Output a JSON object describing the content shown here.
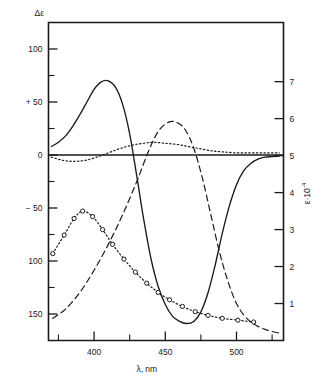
{
  "chart_data": {
    "type": "line",
    "title": "",
    "xlabel": "λ, nm",
    "ylabel_left": "Δε",
    "ylabel_right": "ε·10",
    "ylabel_right_exponent": "-4",
    "xlim": [
      368,
      533
    ],
    "ylim_left": [
      -175,
      125
    ],
    "ylim_right": [
      0,
      8.6
    ],
    "grid": false,
    "legend": "none",
    "xticks_major": [
      400,
      450,
      500
    ],
    "xticks_major_labels": [
      "400",
      "450",
      "500"
    ],
    "xticks_minor": [
      375,
      425,
      475,
      525
    ],
    "yticks_left": [
      100,
      50,
      0,
      -50,
      -100,
      -150
    ],
    "yticks_left_labels": [
      "100",
      "+ 50",
      "0",
      "− 50",
      "100",
      "150"
    ],
    "yticks_left_minor": [
      75,
      25,
      -25,
      -75,
      -125
    ],
    "yticks_right": [
      1,
      2,
      3,
      4,
      5,
      6,
      7
    ],
    "yticks_right_labels": [
      "1",
      "2",
      "3",
      "4",
      "5",
      "6",
      "7"
    ],
    "series": [
      {
        "name": "CD bisignate",
        "style": "solid",
        "axis": "left",
        "markers": "none",
        "points": [
          [
            370,
            8
          ],
          [
            375,
            12
          ],
          [
            380,
            18
          ],
          [
            385,
            27
          ],
          [
            390,
            38
          ],
          [
            395,
            50
          ],
          [
            400,
            62
          ],
          [
            405,
            69
          ],
          [
            410,
            70
          ],
          [
            415,
            64
          ],
          [
            420,
            48
          ],
          [
            425,
            20
          ],
          [
            430,
            -20
          ],
          [
            435,
            -62
          ],
          [
            440,
            -98
          ],
          [
            445,
            -124
          ],
          [
            450,
            -141
          ],
          [
            455,
            -152
          ],
          [
            460,
            -157
          ],
          [
            465,
            -159
          ],
          [
            470,
            -157
          ],
          [
            475,
            -148
          ],
          [
            480,
            -130
          ],
          [
            485,
            -104
          ],
          [
            490,
            -74
          ],
          [
            495,
            -48
          ],
          [
            500,
            -28
          ],
          [
            505,
            -15
          ],
          [
            510,
            -8
          ],
          [
            515,
            -4
          ],
          [
            520,
            -2
          ],
          [
            530,
            -1
          ]
        ]
      },
      {
        "name": "CD baseline",
        "style": "dotted",
        "axis": "left",
        "markers": "none",
        "points": [
          [
            370,
            -2
          ],
          [
            378,
            -5
          ],
          [
            386,
            -6
          ],
          [
            394,
            -5
          ],
          [
            402,
            -2
          ],
          [
            410,
            2
          ],
          [
            418,
            6
          ],
          [
            426,
            9
          ],
          [
            434,
            11
          ],
          [
            442,
            12
          ],
          [
            450,
            11
          ],
          [
            458,
            10
          ],
          [
            466,
            8
          ],
          [
            474,
            6
          ],
          [
            482,
            4
          ],
          [
            490,
            3
          ],
          [
            500,
            2
          ],
          [
            510,
            2
          ],
          [
            520,
            2
          ],
          [
            530,
            2
          ]
        ]
      },
      {
        "name": "Absorption band A",
        "style": "dashed",
        "axis": "right",
        "markers": "none",
        "points": [
          [
            371,
            0.6
          ],
          [
            380,
            0.85
          ],
          [
            390,
            1.3
          ],
          [
            400,
            1.9
          ],
          [
            410,
            2.6
          ],
          [
            420,
            3.4
          ],
          [
            430,
            4.3
          ],
          [
            438,
            5.1
          ],
          [
            445,
            5.65
          ],
          [
            452,
            5.9
          ],
          [
            458,
            5.9
          ],
          [
            464,
            5.7
          ],
          [
            470,
            5.2
          ],
          [
            476,
            4.4
          ],
          [
            482,
            3.4
          ],
          [
            488,
            2.4
          ],
          [
            494,
            1.6
          ],
          [
            500,
            1.0
          ],
          [
            506,
            0.65
          ],
          [
            512,
            0.45
          ],
          [
            520,
            0.3
          ],
          [
            530,
            0.2
          ]
        ]
      },
      {
        "name": "Absorption band B",
        "style": "dotted",
        "axis": "right",
        "markers": "open-circle",
        "points": [
          [
            371,
            2.35
          ],
          [
            379,
            2.85
          ],
          [
            386,
            3.3
          ],
          [
            392,
            3.5
          ],
          [
            399,
            3.35
          ],
          [
            406,
            3.0
          ],
          [
            413,
            2.6
          ],
          [
            421,
            2.2
          ],
          [
            429,
            1.85
          ],
          [
            437,
            1.55
          ],
          [
            445,
            1.3
          ],
          [
            453,
            1.1
          ],
          [
            462,
            0.92
          ],
          [
            471,
            0.78
          ],
          [
            480,
            0.68
          ],
          [
            490,
            0.6
          ],
          [
            501,
            0.55
          ],
          [
            512,
            0.5
          ]
        ]
      }
    ]
  },
  "figure": {
    "frame_color": "#1a1a1a",
    "curve_color": "#1a1a1a"
  }
}
